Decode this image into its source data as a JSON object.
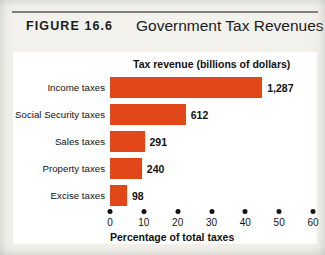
{
  "figure": {
    "number_label": "FIGURE  16.6",
    "title": "Government Tax Revenues"
  },
  "colors": {
    "bar": "#e2471a",
    "text": "#111111",
    "rule": "#7e7d79",
    "panel_background": "#ffffff",
    "page_background": "#f2f1ec"
  },
  "chart_data": {
    "type": "bar",
    "orientation": "horizontal",
    "title": "Government Tax Revenues",
    "value_axis_title": "Tax revenue (billions of dollars)",
    "xlabel": "Percentage of total taxes",
    "ylabel": "",
    "categories": [
      "Income taxes",
      "Social Security taxes",
      "Sales taxes",
      "Property taxes",
      "Excise taxes"
    ],
    "values": [
      1287,
      612,
      291,
      240,
      98
    ],
    "value_labels": [
      "1,287",
      "612",
      "291",
      "240",
      "98"
    ],
    "percent_of_total": [
      45.0,
      22.4,
      10.2,
      9.4,
      5.0
    ],
    "xticks": [
      0,
      10,
      20,
      30,
      40,
      50,
      60
    ],
    "xtick_labels": [
      "0",
      "10",
      "20",
      "30",
      "40",
      "50",
      "60"
    ],
    "xlim": [
      0,
      60
    ],
    "grid": false,
    "legend": false
  }
}
